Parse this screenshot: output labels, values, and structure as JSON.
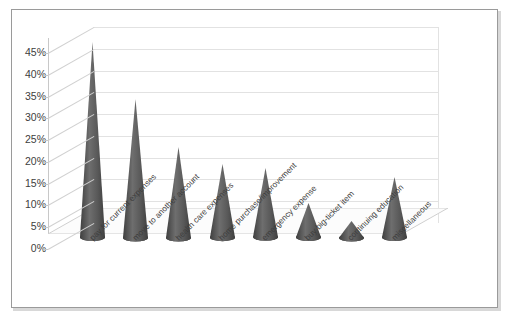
{
  "chart_data": {
    "type": "bar",
    "title": "",
    "subtitle": "",
    "xlabel": "",
    "ylabel": "",
    "categories": [
      "pay for current expenses",
      "move to another account",
      "health care expenses",
      "home purchase/improvement",
      "emergency expense",
      "buy big-ticket item",
      "continuing education",
      "miscellaneous"
    ],
    "values": [
      44,
      31,
      20,
      16,
      15,
      7,
      3,
      13
    ],
    "value_labels": [
      "44%",
      "31%",
      "20%",
      "16%",
      "15%",
      "7%",
      "3%",
      "13%"
    ],
    "ylim": [
      0,
      45
    ],
    "ytick_values": [
      0,
      5,
      10,
      15,
      20,
      25,
      30,
      35,
      40,
      45
    ],
    "ytick_labels": [
      "0%",
      "5%",
      "10%",
      "15%",
      "20%",
      "25%",
      "30%",
      "35%",
      "40%",
      "45%"
    ],
    "grid": true,
    "legend": "none",
    "series_name": "",
    "style": "3d-cone",
    "colors": {
      "bar_fill": "#595959",
      "bar_fill_light": "#6e6e6e",
      "bar_fill_dark": "#3f3f3f",
      "gridline": "#e2e2e2",
      "axis_line": "#c8c8c8",
      "floor_fill": "#fcfcfc",
      "floor_edge": "#d0d0d0",
      "frame_border": "#9a9a9a",
      "text": "#3d3d3d",
      "background": "#ffffff"
    }
  }
}
